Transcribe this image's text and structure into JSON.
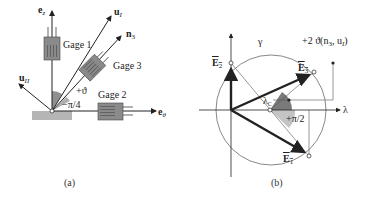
{
  "figure_a": {
    "caption": "(a)",
    "labels": {
      "e_z": "e",
      "e_z_sub": "z",
      "u_I": "u",
      "u_I_sub": "I",
      "n3": "n",
      "n3_sub": "3",
      "u_II": "u",
      "u_II_sub": "II",
      "e_theta": "e",
      "e_theta_sub": "θ",
      "gage1": "Gage 1",
      "gage2": "Gage 2",
      "gage3": "Gage 3",
      "angle_theta": "+ϑ",
      "angle_pi4": "−π/4"
    }
  },
  "figure_b": {
    "caption": "(b)",
    "labels": {
      "gamma": "γ",
      "lambda": "λ",
      "E1": "E",
      "E1_sub": "1",
      "E2": "E",
      "E2_sub": "2",
      "E3": "E",
      "E3_sub": "3",
      "lambda_c": "λ",
      "lambda_c_sub": "C",
      "angle_pi2": "+π/2",
      "annotation": "+2 ϑ(n",
      "annotation_sub": "3",
      "annotation_mid": ", u",
      "annotation_sub2": "I",
      "annotation_end": ")"
    }
  },
  "colors": {
    "gage_fill": "#8a8a8a",
    "ground_fill": "#b5b5b5",
    "sector_dark": "#7a7a7a",
    "sector_light": "#c4c4c4",
    "line": "#222222"
  }
}
